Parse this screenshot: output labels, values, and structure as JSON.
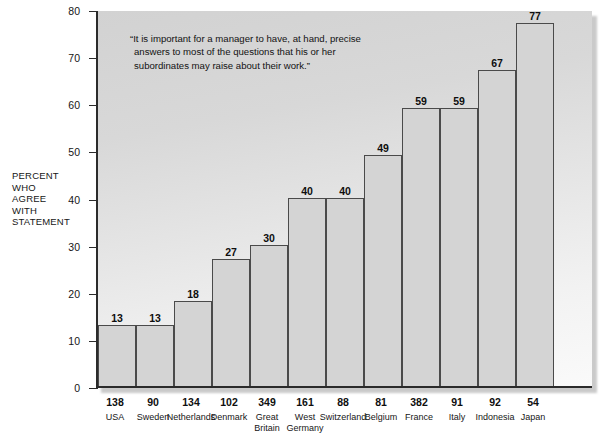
{
  "y_axis_title": [
    "PERCENT",
    "WHO",
    "AGREE",
    "WITH",
    "STATEMENT"
  ],
  "annotation": "“It is important for a manager to have, at hand, precise answers to most of the questions that his or her subordinates may raise about their work.”",
  "colors": {
    "bar_fill": "#d4d4d4",
    "bar_stroke": "#4a4a4a",
    "axis": "#2b2b2b",
    "text": "#161616",
    "plot_bg_top": "#d2d2d2",
    "plot_bg_bottom": "#fafafa"
  },
  "chart_data": {
    "type": "bar",
    "title": "",
    "xlabel": "",
    "ylabel": "PERCENT WHO AGREE WITH STATEMENT",
    "ylim": [
      0,
      80
    ],
    "yticks": [
      0,
      10,
      20,
      30,
      40,
      50,
      60,
      70,
      80
    ],
    "grid": false,
    "legend": "none",
    "annotations": [
      "“It is important for a manager to have, at hand, precise answers to most of the questions that his or her subordinates may raise about their work.”"
    ],
    "categories": [
      "USA",
      "Sweden",
      "Netherlands",
      "Denmark",
      "Great Britain",
      "West Germany",
      "Switzerland",
      "Belgium",
      "France",
      "Italy",
      "Indonesia",
      "Japan"
    ],
    "values": [
      13,
      13,
      18,
      27,
      30,
      40,
      40,
      49,
      59,
      59,
      67,
      77
    ],
    "sample_sizes": [
      138,
      90,
      134,
      102,
      349,
      161,
      88,
      81,
      382,
      91,
      92,
      54
    ],
    "bars": [
      {
        "country": "USA",
        "country_lines": [
          "USA"
        ],
        "value": 13,
        "n": 138
      },
      {
        "country": "Sweden",
        "country_lines": [
          "Sweden"
        ],
        "value": 13,
        "n": 90
      },
      {
        "country": "Netherlands",
        "country_lines": [
          "Netherlands"
        ],
        "value": 18,
        "n": 134
      },
      {
        "country": "Denmark",
        "country_lines": [
          "Denmark"
        ],
        "value": 27,
        "n": 102
      },
      {
        "country": "Great Britain",
        "country_lines": [
          "Great",
          "Britain"
        ],
        "value": 30,
        "n": 349
      },
      {
        "country": "West Germany",
        "country_lines": [
          "West",
          "Germany"
        ],
        "value": 40,
        "n": 161
      },
      {
        "country": "Switzerland",
        "country_lines": [
          "Switzerland"
        ],
        "value": 40,
        "n": 88
      },
      {
        "country": "Belgium",
        "country_lines": [
          "Belgium"
        ],
        "value": 49,
        "n": 81
      },
      {
        "country": "France",
        "country_lines": [
          "France"
        ],
        "value": 59,
        "n": 382
      },
      {
        "country": "Italy",
        "country_lines": [
          "Italy"
        ],
        "value": 59,
        "n": 91
      },
      {
        "country": "Indonesia",
        "country_lines": [
          "Indonesia"
        ],
        "value": 67,
        "n": 92
      },
      {
        "country": "Japan",
        "country_lines": [
          "Japan"
        ],
        "value": 77,
        "n": 54
      }
    ]
  }
}
